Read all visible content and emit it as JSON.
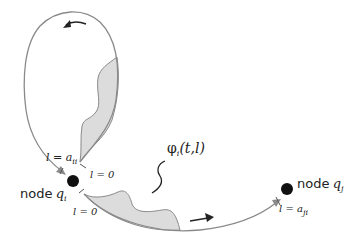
{
  "diagram": {
    "type": "network flow loop diagram",
    "nodes": [
      {
        "id": "qi",
        "label_prefix": "node",
        "symbol": "q",
        "subscript": "i"
      },
      {
        "id": "qj",
        "label_prefix": "node",
        "symbol": "q",
        "subscript": "j"
      }
    ],
    "function_label": {
      "symbol": "φ",
      "subscript": "i",
      "args": "(t,l)"
    },
    "edge_labels": {
      "loop_end": {
        "text": "l = a",
        "subscript": "ii"
      },
      "loop_start": {
        "text": "l = 0"
      },
      "out_start": {
        "text": "l = 0"
      },
      "out_end": {
        "text": "l = a",
        "subscript": "ji"
      }
    },
    "edges": [
      {
        "from": "qi",
        "to": "qi",
        "kind": "self-loop",
        "direction": "counter-clockwise",
        "shaded_profile": true
      },
      {
        "from": "qi",
        "to": "qj",
        "kind": "directed",
        "shaded_profile": true
      }
    ],
    "colors": {
      "stroke": "#8a8a8a",
      "shade": "#dcdcdc",
      "node": "#111111",
      "arrow": "#222222"
    }
  }
}
